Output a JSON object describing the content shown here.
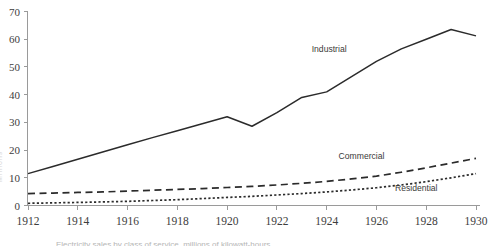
{
  "chart_data": {
    "type": "line",
    "title": "",
    "xlabel": "",
    "ylabel": "",
    "xlim": [
      1912,
      1930
    ],
    "ylim": [
      0,
      70
    ],
    "grid": false,
    "legend_position": "inline-labels",
    "x": [
      1912,
      1913,
      1914,
      1915,
      1916,
      1917,
      1918,
      1919,
      1920,
      1921,
      1922,
      1923,
      1924,
      1925,
      1926,
      1927,
      1928,
      1929,
      1930
    ],
    "xticks": [
      "1912",
      "1914",
      "1916",
      "1918",
      "1920",
      "1922",
      "1924",
      "1926",
      "1928",
      "1930"
    ],
    "yticks": [
      "0",
      "10",
      "20",
      "30",
      "40",
      "50",
      "60",
      "70"
    ],
    "series": [
      {
        "name": "Industrial",
        "style": "solid",
        "label_x": 1924.1,
        "label_y": 55.5,
        "values": [
          11.5,
          14.1,
          16.7,
          19.3,
          21.9,
          24.5,
          27.0,
          29.5,
          32.0,
          28.6,
          33.5,
          39.0,
          41.0,
          46.5,
          52.0,
          56.5,
          60.0,
          63.5,
          61.2
        ]
      },
      {
        "name": "Commercial",
        "style": "long-dash",
        "label_x": 1925.4,
        "label_y": 16.8,
        "values": [
          4.3,
          4.5,
          4.7,
          4.9,
          5.2,
          5.5,
          5.8,
          6.1,
          6.5,
          6.9,
          7.4,
          8.0,
          8.7,
          9.6,
          10.6,
          12.0,
          13.6,
          15.3,
          17.0
        ]
      },
      {
        "name": "Residential",
        "style": "dotted",
        "label_x": 1927.6,
        "label_y": 5.2,
        "values": [
          0.8,
          0.95,
          1.1,
          1.3,
          1.5,
          1.8,
          2.1,
          2.5,
          2.9,
          3.3,
          3.8,
          4.3,
          4.9,
          5.6,
          6.4,
          7.4,
          8.6,
          10.0,
          11.5
        ]
      }
    ]
  },
  "axis": {
    "color": "#9a9a9a"
  },
  "clipped": {
    "ylabel_partial": "Millions",
    "caption_partial": "Electricity sales by class of service, millions of kilowatt-hours"
  }
}
